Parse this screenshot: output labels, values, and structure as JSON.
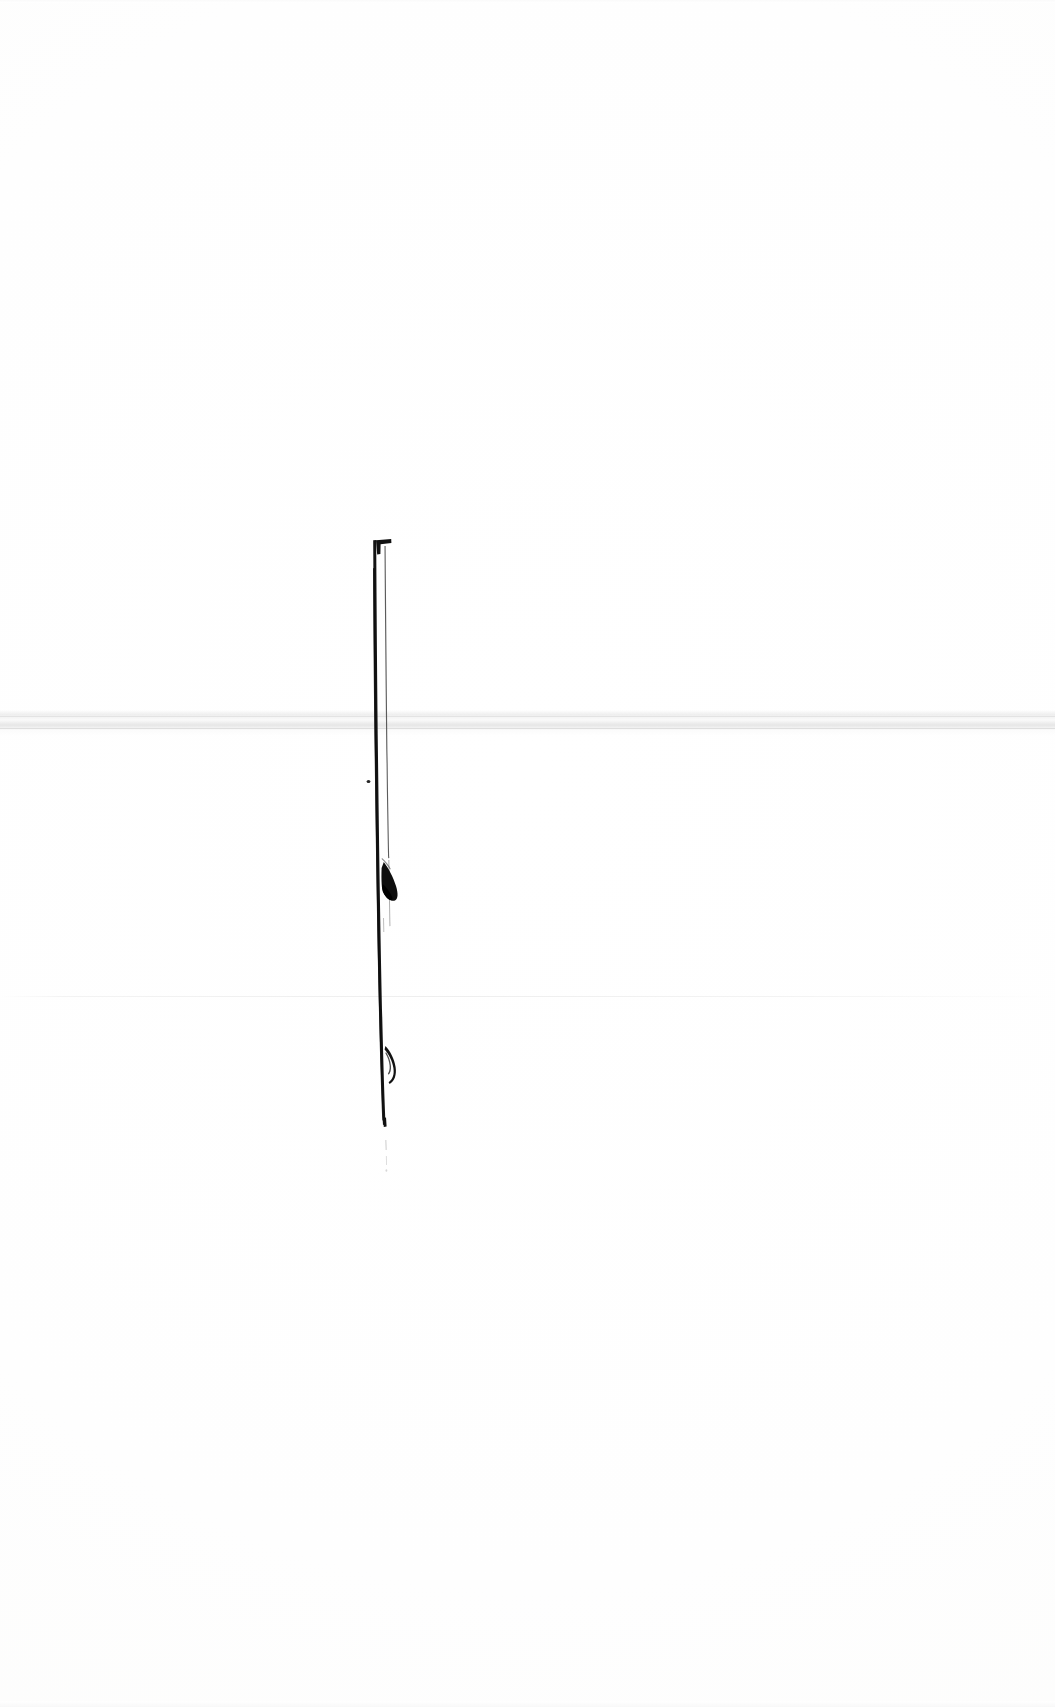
{
  "page": {
    "kind": "scanned-page",
    "width": 1055,
    "height": 1707,
    "background_color": "#fefefe",
    "paper_tone_color": "#fcfcfb"
  },
  "artifacts": {
    "scan_band": {
      "name": "horizontal scan band",
      "color": "#e3e3e3",
      "y": 710,
      "height": 26,
      "spans_full_width": true
    },
    "faint_line": {
      "name": "faint horizontal line",
      "color": "#efefef",
      "y": 996,
      "height": 1,
      "spans_full_width": true
    }
  },
  "ink_mark": {
    "name": "vertical ink stroke",
    "color": "#141414",
    "x": 377,
    "y_top": 540,
    "y_bottom": 1126,
    "stroke_width": 5,
    "parts": [
      {
        "name": "top-serif-hook",
        "description": "short horizontal hook to the right at the top of the stroke"
      },
      {
        "name": "main-vertical-stroke",
        "description": "long tapering vertical black stroke"
      },
      {
        "name": "hairline-parallel",
        "description": "thin parallel hairline just right of the main stroke"
      },
      {
        "name": "ink-dot",
        "description": "small isolated dot left of the stroke"
      },
      {
        "name": "upper-wedge-blob",
        "description": "dark leaf/teardrop wedge attached to the right side"
      },
      {
        "name": "lower-crescent-hook",
        "description": "small crescent hook on the right side near the bottom"
      },
      {
        "name": "fading-tail",
        "description": "faint broken tail continuing below the stroke"
      }
    ]
  }
}
